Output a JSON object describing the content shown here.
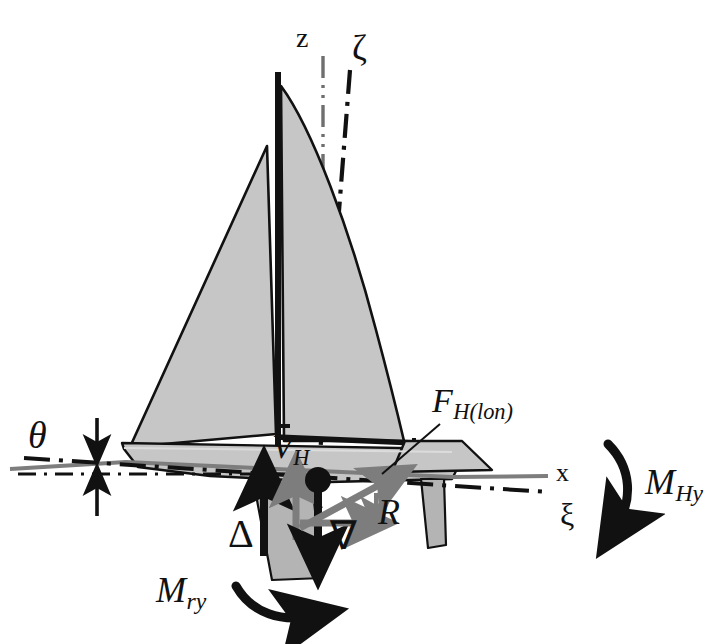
{
  "figure": {
    "kind": "sailing-yacht-free-body-diagram",
    "background_color": "#ffffff",
    "ink_color": "#111111",
    "fill_gray": "#c6c6c6",
    "mid_gray": "#7d7d7d",
    "light_gray": "#8c8c8c"
  },
  "axes": [
    {
      "id": "z",
      "label": "z",
      "style": "italic",
      "description": "vertical earth-fixed axis, gray dash-dot-dot line",
      "color": "#6f6f6f",
      "label_x": 296,
      "label_y": 24,
      "font_size": 28
    },
    {
      "id": "zeta",
      "label": "ζ",
      "style": "upright",
      "description": "vertical body-fixed axis, tilted, black dash-dot line",
      "color": "#111111",
      "label_x": 352,
      "label_y": 32,
      "font_size": 34
    },
    {
      "id": "x",
      "label": "x",
      "style": "upright",
      "description": "horizontal earth-fixed axis, gray line along the still waterline",
      "color": "#6f6f6f",
      "label_x": 556,
      "label_y": 461,
      "font_size": 26
    },
    {
      "id": "xi",
      "label": "ξ",
      "style": "upright",
      "description": "longitudinal body-fixed axis, tilted, black dash-dot line",
      "color": "#111111",
      "label_x": 560,
      "label_y": 501,
      "font_size": 32
    }
  ],
  "angles": [
    {
      "id": "theta",
      "label": "θ",
      "description": "trim / heel angle between x axis and xi axis, marked with a vertical double-headed arrow at the bow",
      "label_x": 28,
      "label_y": 419,
      "font_size": 36
    }
  ],
  "forces": [
    {
      "id": "delta",
      "label": "Δ",
      "meaning": "buoyancy force, heavy black arrow pointing up",
      "color": "#111111",
      "direction": "up",
      "label_x": 228,
      "label_y": 518,
      "font_size": 38
    },
    {
      "id": "nabla",
      "label": "∇",
      "meaning": "displacement weight, heavy black arrow pointing down",
      "color": "#111111",
      "direction": "down",
      "label_x": 330,
      "label_y": 519,
      "font_size": 38
    },
    {
      "id": "V_H",
      "label": "V",
      "sub": "H",
      "meaning": "vertical hydrodynamic force, gray arrow pointing up",
      "color": "#7d7d7d",
      "direction": "up",
      "label_x": 272,
      "label_y": 434,
      "font_size": 34
    },
    {
      "id": "R",
      "label": "R",
      "meaning": "resistance, gray arrow pointing aft along the x axis",
      "color": "#7d7d7d",
      "direction": "right",
      "label_x": 378,
      "label_y": 497,
      "font_size": 34
    },
    {
      "id": "F_H_lon",
      "label": "F",
      "sub": "H(lon)",
      "meaning": "longitudinal hydrodynamic force, gray arrow pointing up and aft, with leader line to the hull",
      "color": "#7d7d7d",
      "direction": "up-right",
      "label_x": 432,
      "label_y": 386,
      "font_size": 34
    }
  ],
  "moments": [
    {
      "id": "M_Hy",
      "label": "M",
      "sub": "Hy",
      "meaning": "hydrodynamic pitching moment, clockwise curved black arrow at the stern",
      "color": "#111111",
      "sense": "clockwise",
      "label_x": 648,
      "label_y": 467,
      "font_size": 36
    },
    {
      "id": "M_ry",
      "label": "M",
      "sub": "ry",
      "meaning": "righting / restoring pitching moment, clockwise curved black arrow below the keel",
      "color": "#111111",
      "sense": "clockwise",
      "label_x": 158,
      "label_y": 576,
      "font_size": 36
    }
  ],
  "boat_parts": [
    {
      "id": "mainsail",
      "name": "mainsail",
      "fill": "#c6c6c6"
    },
    {
      "id": "jib",
      "name": "jib",
      "fill": "#c6c6c6"
    },
    {
      "id": "mast",
      "name": "mast",
      "fill": "#111111"
    },
    {
      "id": "boom",
      "name": "boom",
      "fill": "#111111"
    },
    {
      "id": "hull",
      "name": "hull",
      "fill": "#c6c6c6"
    },
    {
      "id": "deck",
      "name": "deckhouse",
      "fill": "#c6c6c6"
    },
    {
      "id": "keel",
      "name": "keel",
      "fill": "#b4b4b4"
    },
    {
      "id": "rudder",
      "name": "rudder",
      "fill": "#b4b4b4"
    },
    {
      "id": "cg-marker",
      "name": "centre-of-gravity-marker",
      "fill": "#111111"
    }
  ]
}
